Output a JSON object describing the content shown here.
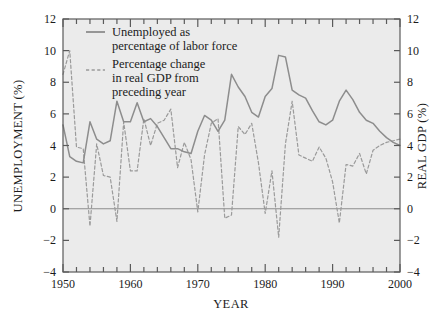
{
  "chart_data": {
    "type": "line",
    "title": "",
    "xlabel": "YEAR",
    "ylabel_left": "UNEMPLOYMENT (%)",
    "ylabel_right": "REAL GDP (%)",
    "xlim": [
      1950,
      2000
    ],
    "ylim": [
      -4,
      12
    ],
    "x_ticks_major": [
      1950,
      1960,
      1970,
      1980,
      1990,
      2000
    ],
    "x_tick_labels": [
      "1950",
      "1960",
      "1970",
      "1980",
      "1990",
      "2000"
    ],
    "x_tick_minor_step": 2,
    "y_ticks": [
      -4,
      -2,
      0,
      2,
      4,
      6,
      8,
      10,
      12
    ],
    "y_tick_labels": [
      "−4",
      "−2",
      "0",
      "2",
      "4",
      "6",
      "8",
      "10",
      "12"
    ],
    "grid": false,
    "zero_line": true,
    "legend_position": "top-left-inside",
    "plot_background": "#ebebeb",
    "line_color": "#8c8c8c",
    "frame_color": "#555555",
    "series": [
      {
        "name": "Unemployed as percentage of labor force",
        "style": "solid",
        "axis": "left",
        "x": [
          1950,
          1951,
          1952,
          1953,
          1954,
          1955,
          1956,
          1957,
          1958,
          1959,
          1960,
          1961,
          1962,
          1963,
          1964,
          1965,
          1966,
          1967,
          1968,
          1969,
          1970,
          1971,
          1972,
          1973,
          1974,
          1975,
          1976,
          1977,
          1978,
          1979,
          1980,
          1981,
          1982,
          1983,
          1984,
          1985,
          1986,
          1987,
          1988,
          1989,
          1990,
          1991,
          1992,
          1993,
          1994,
          1995,
          1996,
          1997,
          1998,
          1999,
          2000
        ],
        "values": [
          5.3,
          3.3,
          3.0,
          2.9,
          5.5,
          4.4,
          4.1,
          4.3,
          6.8,
          5.5,
          5.5,
          6.7,
          5.5,
          5.7,
          5.2,
          4.5,
          3.8,
          3.8,
          3.6,
          3.5,
          4.9,
          5.9,
          5.6,
          4.9,
          5.6,
          8.5,
          7.7,
          7.1,
          6.1,
          5.8,
          7.1,
          7.6,
          9.7,
          9.6,
          7.5,
          7.2,
          7.0,
          6.2,
          5.5,
          5.3,
          5.6,
          6.8,
          7.5,
          6.9,
          6.1,
          5.6,
          5.4,
          4.9,
          4.5,
          4.2,
          4.0
        ]
      },
      {
        "name": "Percentage change in real GDP from preceding year",
        "style": "dashed",
        "axis": "right",
        "x": [
          1950,
          1951,
          1952,
          1953,
          1954,
          1955,
          1956,
          1957,
          1958,
          1959,
          1960,
          1961,
          1962,
          1963,
          1964,
          1965,
          1966,
          1967,
          1968,
          1969,
          1970,
          1971,
          1972,
          1973,
          1974,
          1975,
          1976,
          1977,
          1978,
          1979,
          1980,
          1981,
          1982,
          1983,
          1984,
          1985,
          1986,
          1987,
          1988,
          1989,
          1990,
          1991,
          1992,
          1993,
          1994,
          1995,
          1996,
          1997,
          1998,
          1999,
          2000
        ],
        "values": [
          8.5,
          10.0,
          3.9,
          3.8,
          -1.1,
          4.1,
          2.1,
          2.0,
          -0.8,
          5.5,
          2.4,
          2.4,
          5.7,
          4.0,
          5.4,
          5.6,
          6.3,
          2.6,
          4.2,
          3.1,
          -0.2,
          3.4,
          5.4,
          5.7,
          -0.6,
          -0.4,
          5.2,
          4.7,
          5.4,
          2.9,
          -0.3,
          2.4,
          -1.8,
          4.1,
          6.8,
          3.4,
          3.2,
          3.0,
          3.9,
          3.2,
          1.7,
          -0.9,
          2.8,
          2.7,
          3.5,
          2.2,
          3.7,
          4.0,
          4.2,
          4.3,
          4.4
        ]
      }
    ],
    "legend": [
      {
        "label_line1": "Unemployed as",
        "label_line2": "percentage of labor force",
        "style": "solid"
      },
      {
        "label_line1": "Percentage change",
        "label_line2": "in real GDP from",
        "label_line3": "preceding year",
        "style": "dashed"
      }
    ]
  }
}
